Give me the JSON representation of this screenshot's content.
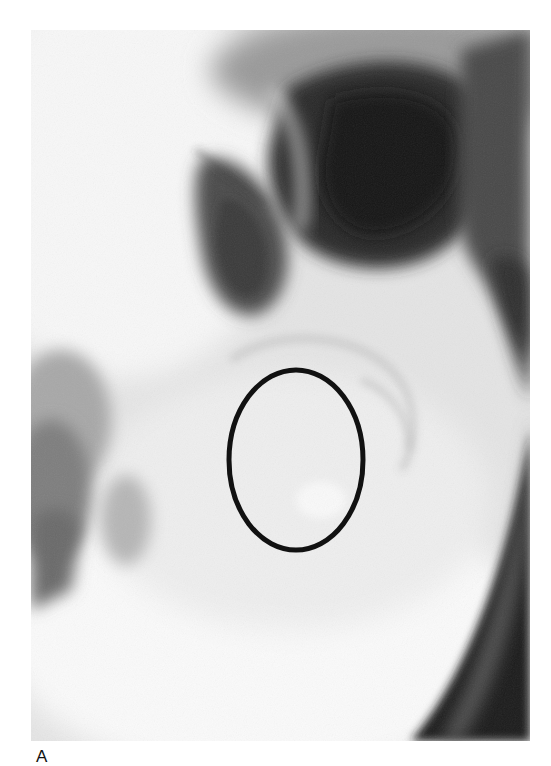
{
  "figure": {
    "type": "radiograph",
    "panel_label": "A",
    "annotation": {
      "shape": "ellipse",
      "color": "#111111",
      "center_x": 265,
      "center_y": 430,
      "radius_x": 67,
      "radius_y": 90,
      "stroke_width": 5
    },
    "colors": {
      "background": "#ffffff",
      "film_light": "#f2f2f2",
      "film_mid": "#9a9a9a",
      "film_dark": "#1e1e1e"
    }
  }
}
